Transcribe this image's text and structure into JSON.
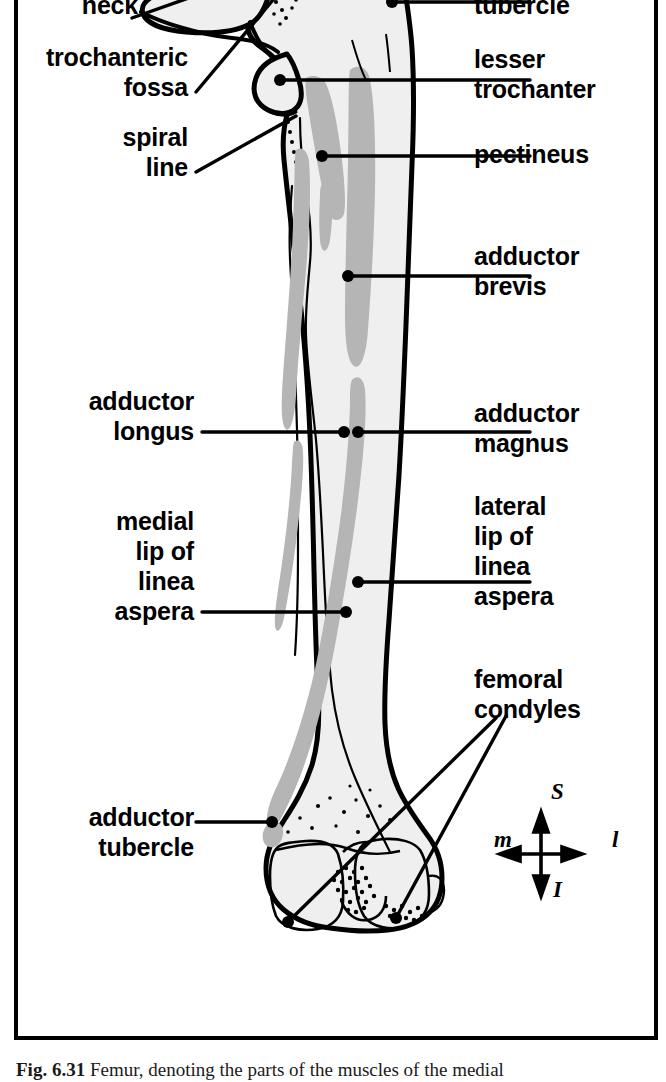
{
  "figure": {
    "title_number": "Fig. 6.31",
    "caption": "Femur, denoting the parts of the muscles of the medial",
    "border_color": "#000000",
    "bone_fill": "#efefef",
    "bone_outline": "#000000",
    "muscle_marking_gray": "#b5b5b5"
  },
  "labels_left": [
    {
      "id": "neck",
      "text": "neck"
    },
    {
      "id": "trochanteric-fossa",
      "text": "trochanteric\nfossa"
    },
    {
      "id": "spiral-line",
      "text": "spiral\nline"
    },
    {
      "id": "adductor-longus",
      "text": "adductor\nlongus"
    },
    {
      "id": "medial-lip-linea-aspera",
      "text": "medial\nlip of\nlinea\naspera"
    },
    {
      "id": "adductor-tubercle",
      "text": "adductor\ntubercle"
    }
  ],
  "labels_right": [
    {
      "id": "quadrate-tubercle",
      "text": "tubercle"
    },
    {
      "id": "lesser-trochanter",
      "text": "lesser\ntrochanter"
    },
    {
      "id": "pectineus",
      "text": "pectineus"
    },
    {
      "id": "adductor-brevis",
      "text": "adductor\nbrevis"
    },
    {
      "id": "adductor-magnus",
      "text": "adductor\nmagnus"
    },
    {
      "id": "lateral-lip-linea-aspera",
      "text": "lateral\nlip of\nlinea\naspera"
    },
    {
      "id": "femoral-condyles",
      "text": "femoral\ncondyles"
    }
  ],
  "compass": {
    "superior": "S",
    "inferior": "I",
    "medial": "m",
    "lateral": "l"
  }
}
